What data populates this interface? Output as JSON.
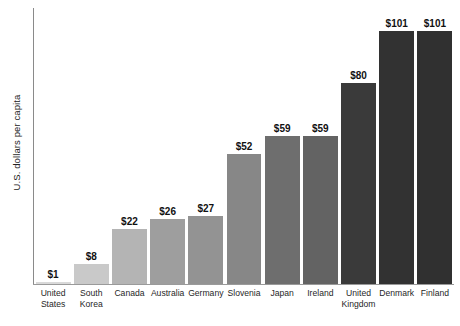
{
  "chart_data": {
    "type": "bar",
    "title": "",
    "subtitle": "",
    "xlabel": "",
    "ylabel": "U.S. dollars per capita",
    "ylim": [
      0,
      110
    ],
    "grid": false,
    "legend": "none",
    "value_prefix": "$",
    "categories": [
      "United States",
      "South Korea",
      "Canada",
      "Australia",
      "Germany",
      "Slovenia",
      "Japan",
      "Ireland",
      "United Kingdom",
      "Denmark",
      "Finland"
    ],
    "values": [
      1,
      8,
      22,
      26,
      27,
      52,
      59,
      59,
      80,
      101,
      101
    ],
    "value_labels": [
      "$1",
      "$8",
      "$22",
      "$26",
      "$27",
      "$52",
      "$59",
      "$59",
      "$80",
      "$101",
      "$101"
    ],
    "bar_colors": [
      "#d9d9d9",
      "#c9c9c9",
      "#b4b4b4",
      "#9e9e9e",
      "#939393",
      "#878787",
      "#6e6e6e",
      "#636363",
      "#3a3a3a",
      "#323232",
      "#303030"
    ],
    "points": [
      {
        "category": "United States",
        "label_line1": "United",
        "label_line2": "States",
        "value": 1,
        "value_label": "$1",
        "color": "#d9d9d9"
      },
      {
        "category": "South Korea",
        "label_line1": "South",
        "label_line2": "Korea",
        "value": 8,
        "value_label": "$8",
        "color": "#c9c9c9"
      },
      {
        "category": "Canada",
        "label_line1": "Canada",
        "label_line2": "",
        "value": 22,
        "value_label": "$22",
        "color": "#b4b4b4"
      },
      {
        "category": "Australia",
        "label_line1": "Australia",
        "label_line2": "",
        "value": 26,
        "value_label": "$26",
        "color": "#9e9e9e"
      },
      {
        "category": "Germany",
        "label_line1": "Germany",
        "label_line2": "",
        "value": 27,
        "value_label": "$27",
        "color": "#939393"
      },
      {
        "category": "Slovenia",
        "label_line1": "Slovenia",
        "label_line2": "",
        "value": 52,
        "value_label": "$52",
        "color": "#878787"
      },
      {
        "category": "Japan",
        "label_line1": "Japan",
        "label_line2": "",
        "value": 59,
        "value_label": "$59",
        "color": "#6e6e6e"
      },
      {
        "category": "Ireland",
        "label_line1": "Ireland",
        "label_line2": "",
        "value": 59,
        "value_label": "$59",
        "color": "#636363"
      },
      {
        "category": "United Kingdom",
        "label_line1": "United",
        "label_line2": "Kingdom",
        "value": 80,
        "value_label": "$80",
        "color": "#3a3a3a"
      },
      {
        "category": "Denmark",
        "label_line1": "Denmark",
        "label_line2": "",
        "value": 101,
        "value_label": "$101",
        "color": "#323232"
      },
      {
        "category": "Finland",
        "label_line1": "Finland",
        "label_line2": "",
        "value": 101,
        "value_label": "$101",
        "color": "#303030"
      }
    ]
  },
  "axis": {
    "y_label": "U.S. dollars per capita"
  }
}
